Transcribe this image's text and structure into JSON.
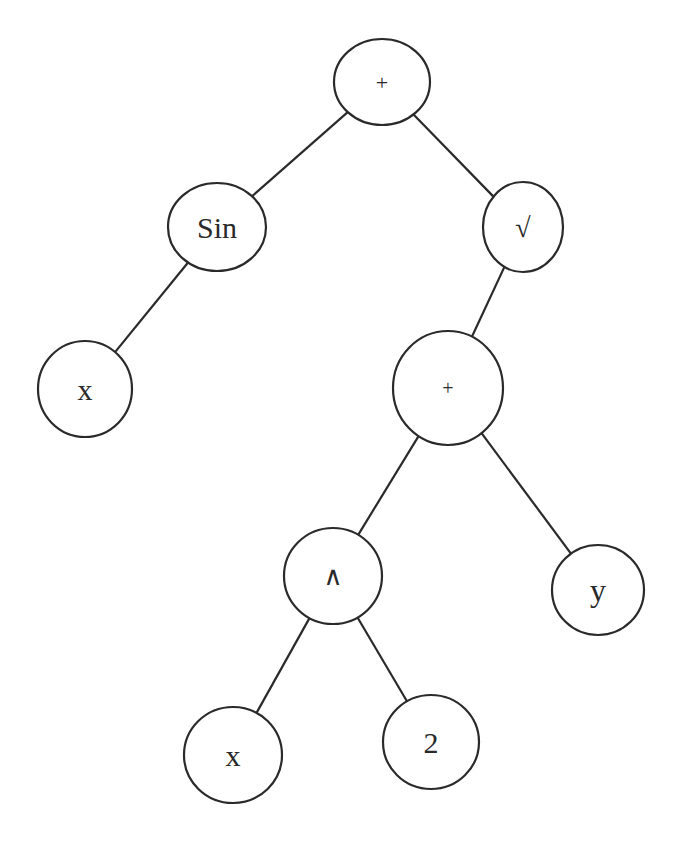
{
  "diagram": {
    "type": "expression-tree",
    "expression": "Sin(x) + √(x^2 + y)",
    "colors": {
      "stroke": "#2a2a2a",
      "fill": "#ffffff",
      "text": "#2a2a2a"
    },
    "nodes": [
      {
        "id": "root_plus",
        "label": "+",
        "cx": 382,
        "cy": 82,
        "rx": 48,
        "ry": 43,
        "font_size": 22
      },
      {
        "id": "sin",
        "label": "Sin",
        "cx": 217,
        "cy": 227,
        "rx": 49,
        "ry": 44,
        "font_size": 30
      },
      {
        "id": "sqrt",
        "label": "√",
        "cx": 523,
        "cy": 227,
        "rx": 40,
        "ry": 45,
        "font_size": 28
      },
      {
        "id": "x1",
        "label": "x",
        "cx": 85,
        "cy": 389,
        "rx": 47,
        "ry": 48,
        "font_size": 30
      },
      {
        "id": "mid_plus",
        "label": "+",
        "cx": 448,
        "cy": 388,
        "rx": 55,
        "ry": 57,
        "font_size": 20
      },
      {
        "id": "pow",
        "label": "∧",
        "cx": 333,
        "cy": 576,
        "rx": 49,
        "ry": 48,
        "font_size": 26
      },
      {
        "id": "y",
        "label": "y",
        "cx": 598,
        "cy": 590,
        "rx": 46,
        "ry": 45,
        "font_size": 32
      },
      {
        "id": "x2",
        "label": "x",
        "cx": 233,
        "cy": 755,
        "rx": 49,
        "ry": 48,
        "font_size": 30
      },
      {
        "id": "two",
        "label": "2",
        "cx": 431,
        "cy": 742,
        "rx": 48,
        "ry": 47,
        "font_size": 30
      }
    ],
    "edges": [
      {
        "from": "root_plus",
        "to": "sin"
      },
      {
        "from": "root_plus",
        "to": "sqrt"
      },
      {
        "from": "sin",
        "to": "x1"
      },
      {
        "from": "sqrt",
        "to": "mid_plus"
      },
      {
        "from": "mid_plus",
        "to": "pow"
      },
      {
        "from": "mid_plus",
        "to": "y"
      },
      {
        "from": "pow",
        "to": "x2"
      },
      {
        "from": "pow",
        "to": "two"
      }
    ]
  }
}
